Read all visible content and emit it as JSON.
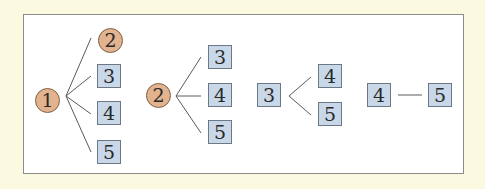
{
  "colors": {
    "page_background": "#fcf9e1",
    "frame_background": "#ffffff",
    "frame_border": "#8c8c8c",
    "circle_fill": "#e2b38e",
    "circle_border": "#7f6148",
    "box_fill": "#c8d8e8",
    "box_border": "#6c7885",
    "line": "#5a5a5a"
  },
  "groups": [
    {
      "root": {
        "label": "1",
        "shape": "circle"
      },
      "children": [
        {
          "label": "2",
          "shape": "circle"
        },
        {
          "label": "3",
          "shape": "box"
        },
        {
          "label": "4",
          "shape": "box"
        },
        {
          "label": "5",
          "shape": "box"
        }
      ]
    },
    {
      "root": {
        "label": "2",
        "shape": "circle"
      },
      "children": [
        {
          "label": "3",
          "shape": "box"
        },
        {
          "label": "4",
          "shape": "box"
        },
        {
          "label": "5",
          "shape": "box"
        }
      ]
    },
    {
      "root": {
        "label": "3",
        "shape": "box"
      },
      "children": [
        {
          "label": "4",
          "shape": "box"
        },
        {
          "label": "5",
          "shape": "box"
        }
      ]
    },
    {
      "root": {
        "label": "4",
        "shape": "box"
      },
      "children": [
        {
          "label": "5",
          "shape": "box"
        }
      ]
    }
  ]
}
